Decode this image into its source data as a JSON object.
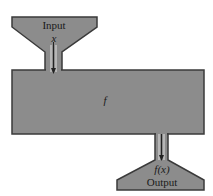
{
  "diagram": {
    "input_label": "Input",
    "input_var": "x",
    "function_label": "f",
    "output_var": "f(x)",
    "output_label": "Output",
    "colors": {
      "fill": "#8c8c8c",
      "stroke": "#3a3a3a",
      "arrow": "#222222",
      "background": "#ffffff"
    }
  }
}
